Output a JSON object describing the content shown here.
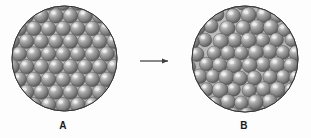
{
  "figure": {
    "background_color": "#fdfdfd",
    "panels": [
      {
        "id": "panel-a",
        "label": "A",
        "packing": "ordered",
        "description": "ordered close-packed spheres",
        "center_x": 64.5,
        "center_y": 58.5,
        "radius": 52.5,
        "sphere_radius": 7.3,
        "row_spacing": 12.7,
        "col_spacing": 14.6,
        "label_x": 63,
        "label_y": 126
      },
      {
        "id": "panel-b",
        "label": "B",
        "packing": "disordered",
        "description": "disordered randomly packed spheres",
        "center_x": 245,
        "center_y": 59,
        "radius": 53,
        "sphere_radius": 7.3,
        "row_spacing": 12.7,
        "col_spacing": 14.6,
        "jitter": 3.4,
        "label_x": 244,
        "label_y": 126
      }
    ],
    "arrow": {
      "name": "transition-arrow",
      "x1": 140,
      "y1": 61,
      "x2": 169,
      "y2": 61,
      "color": "#4a4a4a",
      "head_length": 6,
      "head_width": 4
    },
    "colors": {
      "circle_outline": "#3a3a3a",
      "circle_fill": "#b9b9b9",
      "sphere_base": "#8c8c8c",
      "sphere_highlight": "#e2e2e2",
      "sphere_midtone": "#9a9a9a",
      "sphere_shadow": "#555555",
      "sphere_edge": "#4d4d4d",
      "label_color": "#1a1a1a",
      "arrow_color": "#4a4a4a"
    }
  }
}
